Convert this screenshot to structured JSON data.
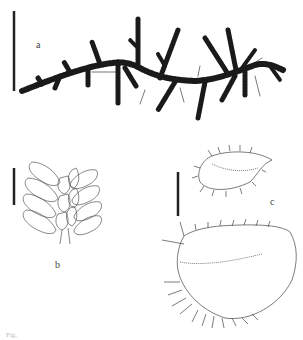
{
  "figure": {
    "panels": [
      {
        "id": "a",
        "label": "a",
        "subject": "moss shoot, habit"
      },
      {
        "id": "b",
        "label": "b",
        "subject": "portion of shoot with leaves"
      },
      {
        "id": "c",
        "label": "c",
        "subject": "leaves"
      }
    ],
    "caption": "Fig."
  }
}
